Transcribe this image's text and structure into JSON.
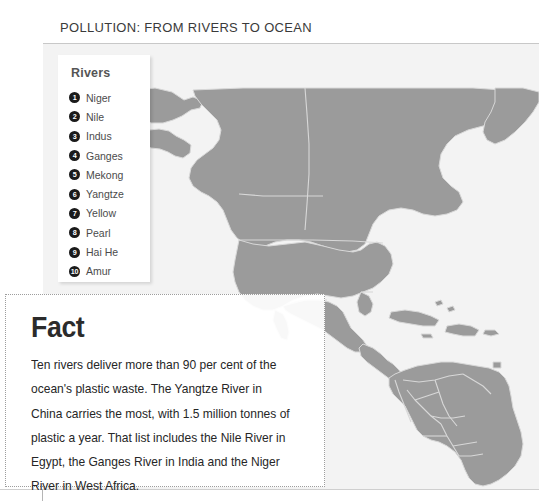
{
  "page": {
    "title": "POLLUTION: FROM RIVERS TO OCEAN"
  },
  "legend": {
    "heading": "Rivers",
    "items": [
      {
        "number": "❶",
        "marker": "1",
        "label": "Niger"
      },
      {
        "number": "❷",
        "marker": "2",
        "label": "Nile"
      },
      {
        "number": "❸",
        "marker": "3",
        "label": "Indus"
      },
      {
        "number": "❹",
        "marker": "4",
        "label": "Ganges"
      },
      {
        "number": "❺",
        "marker": "5",
        "label": "Mekong"
      },
      {
        "number": "❻",
        "marker": "6",
        "label": "Yangtze"
      },
      {
        "number": "❼",
        "marker": "7",
        "label": "Yellow"
      },
      {
        "number": "❽",
        "marker": "8",
        "label": "Pearl"
      },
      {
        "number": "❾",
        "marker": "9",
        "label": "Hai He"
      },
      {
        "number": "❿",
        "marker": "10",
        "label": "Amur"
      }
    ]
  },
  "fact": {
    "heading": "Fact",
    "body": "Ten rivers deliver more than 90 per cent of the ocean's plastic waste. The Yangtze River in China carries the most, with 1.5 million tonnes of plastic a year. That list includes the Nile River in Egypt, the Ganges River in India and the Niger River in West Africa."
  },
  "map": {
    "name": "world-map-americas",
    "land_color": "#9b9b9b",
    "ocean_color": "#f3f3f3",
    "border_color": "#d7d7d7"
  },
  "colors": {
    "title_text": "#3a3a3a",
    "legend_bullet": "#1b1b1b",
    "legend_text": "#4b4b4b",
    "fact_text": "#262626",
    "fact_border": "#9d9d9d"
  }
}
